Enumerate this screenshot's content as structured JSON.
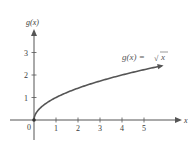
{
  "chart_data": {
    "type": "line",
    "title": "",
    "function_label": "g(x) = √x",
    "function_label_parts": {
      "lhs": "g(x) =",
      "radical": "√",
      "radicand": "x"
    },
    "xlabel": "x",
    "ylabel": "g(x)",
    "origin_label": "0",
    "x_ticks": [
      1,
      2,
      3,
      4,
      5
    ],
    "y_ticks": [
      1,
      2,
      3
    ],
    "xlim": [
      -1.4,
      6.3
    ],
    "ylim": [
      -0.9,
      4.3
    ],
    "grid": false,
    "legend": "none",
    "series": [
      {
        "name": "g(x) = √x",
        "color": "#555555",
        "x": [
          0,
          0.25,
          0.5,
          1,
          1.5,
          2,
          2.5,
          3,
          3.5,
          4,
          4.5,
          5,
          5.5,
          5.8
        ],
        "y": [
          0,
          0.5,
          0.71,
          1,
          1.22,
          1.41,
          1.58,
          1.73,
          1.87,
          2,
          2.12,
          2.24,
          2.35,
          2.41
        ]
      }
    ],
    "annotations": [
      {
        "text": "g(x) = √x",
        "x": 4.4,
        "y": 2.7
      }
    ],
    "colors": {
      "axis": "#555555",
      "curve": "#555555",
      "text": "#3a3a3a"
    }
  }
}
